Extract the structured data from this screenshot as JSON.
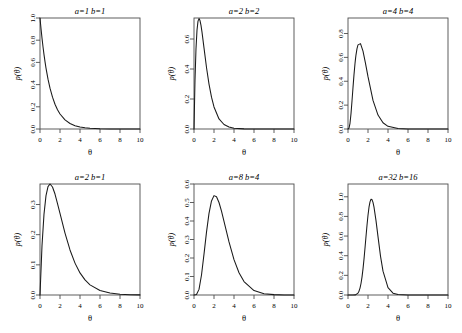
{
  "figure": {
    "type": "grid-of-plots",
    "rows": 2,
    "cols": 3,
    "background": "#ffffff",
    "line_color": "#1a1a1a",
    "axis_color": "#4d4d4d",
    "xlabel": "θ",
    "ylabel": "p(θ)"
  },
  "chart_data": [
    {
      "type": "line",
      "title": "a=1 b=1",
      "params": {
        "a": 1,
        "b": 1
      },
      "xlabel": "θ",
      "ylabel": "p(θ)",
      "xlim": [
        0,
        10
      ],
      "ylim": [
        0,
        1.0
      ],
      "xticks": [
        0,
        2,
        4,
        6,
        8,
        10
      ],
      "xticklabels": [
        "0",
        "2",
        "4",
        "6",
        "8",
        "10"
      ],
      "yticks": [
        0.0,
        0.2,
        0.4,
        0.6,
        0.8,
        1.0
      ],
      "yticklabels": [
        "0.0",
        "0.2",
        "0.4",
        "0.6",
        "0.8",
        "1.0"
      ],
      "grid": false,
      "legend": null,
      "x": [
        0.0,
        0.1,
        0.2,
        0.3,
        0.4,
        0.5,
        0.6,
        0.8,
        1.0,
        1.25,
        1.5,
        1.75,
        2.0,
        2.5,
        3.0,
        3.5,
        4.0,
        4.5,
        5.0,
        6.0,
        7.0,
        8.0,
        9.0,
        10.0
      ],
      "y": [
        1.0,
        0.905,
        0.819,
        0.741,
        0.67,
        0.607,
        0.549,
        0.449,
        0.368,
        0.287,
        0.223,
        0.174,
        0.135,
        0.082,
        0.05,
        0.03,
        0.018,
        0.011,
        0.0067,
        0.0025,
        0.0009,
        0.0003,
        0.0001,
        5e-05
      ]
    },
    {
      "type": "line",
      "title": "a=2 b=2",
      "params": {
        "a": 2,
        "b": 2
      },
      "xlabel": "θ",
      "ylabel": "p(θ)",
      "xlim": [
        0,
        10
      ],
      "ylim": [
        0,
        0.74
      ],
      "xticks": [
        0,
        2,
        4,
        6,
        8,
        10
      ],
      "xticklabels": [
        "0",
        "2",
        "4",
        "6",
        "8",
        "10"
      ],
      "yticks": [
        0.0,
        0.2,
        0.4,
        0.6
      ],
      "yticklabels": [
        "0.0",
        "0.2",
        "0.4",
        "0.6"
      ],
      "grid": false,
      "legend": null,
      "x": [
        0.0,
        0.1,
        0.2,
        0.3,
        0.4,
        0.5,
        0.6,
        0.7,
        0.8,
        1.0,
        1.25,
        1.5,
        1.75,
        2.0,
        2.5,
        3.0,
        3.5,
        4.0,
        5.0,
        6.0,
        7.0,
        8.0,
        9.0,
        10.0
      ],
      "y": [
        0.0,
        0.327,
        0.536,
        0.659,
        0.719,
        0.736,
        0.723,
        0.691,
        0.646,
        0.541,
        0.41,
        0.299,
        0.212,
        0.147,
        0.067,
        0.03,
        0.013,
        0.0054,
        0.0009,
        0.00015,
        2e-05,
        0.0,
        0.0,
        0.0
      ]
    },
    {
      "type": "line",
      "title": "a=4 b=4",
      "params": {
        "a": 4,
        "b": 4
      },
      "xlabel": "θ",
      "ylabel": "p(θ)",
      "xlim": [
        0,
        10
      ],
      "ylim": [
        0,
        0.93
      ],
      "xticks": [
        0,
        2,
        4,
        6,
        8,
        10
      ],
      "xticklabels": [
        "0",
        "2",
        "4",
        "6",
        "8",
        "10"
      ],
      "yticks": [
        0.0,
        0.2,
        0.4,
        0.6,
        0.8
      ],
      "yticklabels": [
        "0.0",
        "0.2",
        "0.4",
        "0.6",
        "0.8"
      ],
      "grid": false,
      "legend": null,
      "x": [
        0.0,
        0.1,
        0.2,
        0.3,
        0.4,
        0.5,
        0.6,
        0.7,
        0.75,
        0.8,
        0.9,
        1.0,
        1.25,
        1.5,
        1.75,
        2.0,
        2.5,
        3.0,
        3.5,
        4.0,
        5.0,
        6.0,
        8.0,
        10.0
      ],
      "y": [
        0.0,
        0.0071,
        0.0479,
        0.1286,
        0.2341,
        0.3477,
        0.4557,
        0.5483,
        0.5879,
        0.6216,
        0.674,
        0.705,
        0.7153,
        0.6525,
        0.5504,
        0.4385,
        0.2397,
        0.1169,
        0.0527,
        0.0225,
        0.0036,
        0.00052,
        1e-05,
        0.0
      ]
    },
    {
      "type": "line",
      "title": "a=2 b=1",
      "params": {
        "a": 2,
        "b": 1
      },
      "xlabel": "θ",
      "ylabel": "p(θ)",
      "xlim": [
        0,
        10
      ],
      "ylim": [
        0,
        0.368
      ],
      "xticks": [
        0,
        2,
        4,
        6,
        8,
        10
      ],
      "xticklabels": [
        "0",
        "2",
        "4",
        "6",
        "8",
        "10"
      ],
      "yticks": [
        0.0,
        0.1,
        0.2,
        0.3
      ],
      "yticklabels": [
        "0.0",
        "0.1",
        "0.2",
        "0.3"
      ],
      "grid": false,
      "legend": null,
      "x": [
        0.0,
        0.2,
        0.4,
        0.6,
        0.8,
        1.0,
        1.25,
        1.5,
        1.75,
        2.0,
        2.5,
        3.0,
        3.5,
        4.0,
        4.5,
        5.0,
        6.0,
        7.0,
        8.0,
        9.0,
        10.0
      ],
      "y": [
        0.0,
        0.1637,
        0.2681,
        0.3293,
        0.3595,
        0.3679,
        0.3581,
        0.3347,
        0.3033,
        0.2707,
        0.2052,
        0.1494,
        0.1057,
        0.0733,
        0.05,
        0.0337,
        0.0149,
        0.0064,
        0.0027,
        0.0011,
        0.00045
      ]
    },
    {
      "type": "line",
      "title": "a=8 b=4",
      "params": {
        "a": 8,
        "b": 4
      },
      "xlabel": "θ",
      "ylabel": "p(θ)",
      "xlim": [
        0,
        10
      ],
      "ylim": [
        0,
        0.6
      ],
      "xticks": [
        0,
        2,
        4,
        6,
        8,
        10
      ],
      "xticklabels": [
        "0",
        "2",
        "4",
        "6",
        "8",
        "10"
      ],
      "yticks": [
        0.0,
        0.1,
        0.2,
        0.3,
        0.4,
        0.5,
        0.6
      ],
      "yticklabels": [
        "0.0",
        "0.1",
        "0.2",
        "0.3",
        "0.4",
        "0.5",
        "0.6"
      ],
      "grid": false,
      "legend": null,
      "x": [
        0.0,
        0.25,
        0.5,
        0.75,
        1.0,
        1.25,
        1.5,
        1.75,
        2.0,
        2.25,
        2.5,
        2.75,
        3.0,
        3.5,
        4.0,
        4.5,
        5.0,
        6.0,
        7.0,
        8.0,
        9.0,
        10.0
      ],
      "y": [
        0.0,
        0.0026,
        0.0303,
        0.108,
        0.2211,
        0.34,
        0.4409,
        0.5083,
        0.5372,
        0.5315,
        0.5,
        0.4528,
        0.3983,
        0.2868,
        0.1912,
        0.1205,
        0.0728,
        0.024,
        0.0072,
        0.002,
        0.00054,
        0.00014
      ]
    },
    {
      "type": "line",
      "title": "a=32 b=16",
      "params": {
        "a": 32,
        "b": 16
      },
      "xlabel": "θ",
      "ylabel": "p(θ)",
      "xlim": [
        0,
        10
      ],
      "ylim": [
        0,
        1.13
      ],
      "xticks": [
        0,
        2,
        4,
        6,
        8,
        10
      ],
      "xticklabels": [
        "0",
        "2",
        "4",
        "6",
        "8",
        "10"
      ],
      "yticks": [
        0.0,
        0.2,
        0.4,
        0.6,
        0.8,
        1.0
      ],
      "yticklabels": [
        "0.0",
        "0.2",
        "0.4",
        "0.6",
        "0.8",
        "1.0"
      ],
      "grid": false,
      "legend": null,
      "x": [
        0.0,
        0.5,
        0.75,
        1.0,
        1.1,
        1.2,
        1.3,
        1.4,
        1.5,
        1.6,
        1.7,
        1.8,
        1.9,
        2.0,
        2.1,
        2.2,
        2.3,
        2.4,
        2.5,
        2.6,
        2.8,
        3.0,
        3.25,
        3.5,
        4.0,
        4.5,
        5.0,
        6.0,
        8.0,
        10.0
      ],
      "y": [
        0.0,
        0.0,
        0.0013,
        0.0195,
        0.0389,
        0.0703,
        0.1172,
        0.182,
        0.2654,
        0.3655,
        0.478,
        0.596,
        0.7106,
        0.8124,
        0.8937,
        0.9486,
        0.9744,
        0.9715,
        0.9432,
        0.8944,
        0.7569,
        0.5944,
        0.3958,
        0.2423,
        0.0743,
        0.019,
        0.0043,
        0.00016,
        0.0,
        0.0
      ]
    }
  ]
}
